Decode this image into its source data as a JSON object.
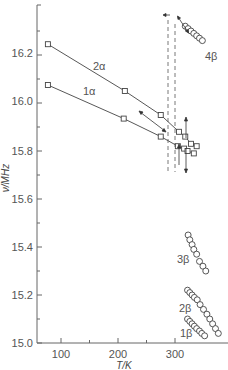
{
  "chart_data": {
    "type": "line",
    "title": "",
    "xlabel": "T/K",
    "ylabel": "ν/MHz",
    "xlim": [
      58,
      370
    ],
    "ylim": [
      15.0,
      16.38
    ],
    "x_ticks": [
      100,
      200,
      300
    ],
    "x_minor_ticks": [
      150,
      250
    ],
    "y_ticks": [
      15.0,
      15.2,
      15.4,
      15.6,
      15.8,
      16.0,
      16.2
    ],
    "y_tick_labels": [
      "15.0",
      "15.2",
      "15.4",
      "15.6",
      "15.8",
      "16.0",
      "16.2"
    ],
    "grid": false,
    "legend": "inline labels",
    "series": [
      {
        "name": "2α",
        "marker": "square",
        "line": true,
        "points": [
          [
            77,
            16.245
          ],
          [
            212,
            16.05
          ],
          [
            275,
            15.95
          ],
          [
            307,
            15.88
          ],
          [
            318,
            15.86
          ],
          [
            328,
            15.83
          ],
          [
            338,
            15.82
          ]
        ]
      },
      {
        "name": "1α",
        "marker": "square",
        "line": true,
        "points": [
          [
            77,
            16.075
          ],
          [
            210,
            15.935
          ],
          [
            275,
            15.86
          ],
          [
            305,
            15.82
          ],
          [
            316,
            15.81
          ],
          [
            322,
            15.8
          ],
          [
            333,
            15.79
          ]
        ]
      },
      {
        "name": "4β",
        "marker": "circle",
        "line": false,
        "points": [
          [
            318,
            16.32
          ],
          [
            323,
            16.31
          ],
          [
            328,
            16.3
          ],
          [
            333,
            16.29
          ],
          [
            338,
            16.28
          ],
          [
            343,
            16.27
          ],
          [
            348,
            16.26
          ]
        ]
      },
      {
        "name": "3β",
        "marker": "circle",
        "line": false,
        "points": [
          [
            323,
            15.45
          ],
          [
            326,
            15.43
          ],
          [
            330,
            15.41
          ],
          [
            333,
            15.39
          ],
          [
            338,
            15.37
          ],
          [
            343,
            15.34
          ],
          [
            349,
            15.32
          ],
          [
            354,
            15.3
          ]
        ]
      },
      {
        "name": "2β",
        "marker": "circle",
        "line": false,
        "points": [
          [
            322,
            15.22
          ],
          [
            326,
            15.21
          ],
          [
            330,
            15.2
          ],
          [
            334,
            15.19
          ],
          [
            339,
            15.18
          ],
          [
            344,
            15.16
          ],
          [
            350,
            15.14
          ],
          [
            356,
            15.12
          ],
          [
            361,
            15.1
          ],
          [
            366,
            15.08
          ],
          [
            371,
            15.06
          ],
          [
            376,
            15.04
          ]
        ]
      },
      {
        "name": "1β",
        "marker": "circle",
        "line": false,
        "points": [
          [
            322,
            15.1
          ],
          [
            326,
            15.09
          ],
          [
            330,
            15.08
          ],
          [
            334,
            15.07
          ],
          [
            338,
            15.06
          ],
          [
            343,
            15.05
          ],
          [
            347,
            15.04
          ],
          [
            352,
            15.03
          ]
        ]
      }
    ],
    "annotations": [
      {
        "type": "dashed-vertical-line",
        "x": 318,
        "y_range": [
          15.68,
          16.32
        ]
      },
      {
        "type": "dashed-vertical-line",
        "x": 330,
        "y_range": [
          15.68,
          16.29
        ]
      },
      {
        "type": "arrow",
        "description": "double arrow along 4β series"
      },
      {
        "type": "arrow",
        "description": "double arrow between 1α and 2α curves"
      },
      {
        "type": "arrow",
        "description": "up/down arrows on dashed lines near 15.8 MHz"
      }
    ]
  },
  "labels": {
    "y_axis": "ν/MHz",
    "x_axis": "T/K",
    "s2a": "2α",
    "s1a": "1α",
    "s4b": "4β",
    "s3b": "3β",
    "s2b": "2β",
    "s1b": "1β",
    "y0": "15.0",
    "y1": "15.2",
    "y2": "15.4",
    "y3": "15.6",
    "y4": "15.8",
    "y5": "16.0",
    "y6": "16.2",
    "x0": "100",
    "x1": "200",
    "x2": "300"
  }
}
